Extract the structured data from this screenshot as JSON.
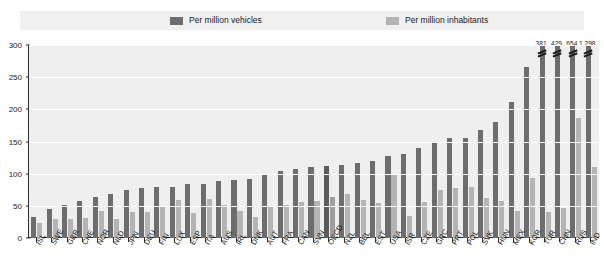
{
  "legend": {
    "items": [
      {
        "label": "Per million vehicles",
        "color": "#6d6d6d",
        "icon": "square-swatch-icon"
      },
      {
        "label": "Per million inhabitants",
        "color": "#b4b4b4",
        "icon": "square-swatch-icon"
      }
    ]
  },
  "chart_data": {
    "type": "bar",
    "title": "",
    "xlabel": "",
    "ylabel": "",
    "ylim": [
      0,
      300
    ],
    "yticks": [
      0,
      50,
      100,
      150,
      200,
      250,
      300
    ],
    "ytick_labels": [
      "0",
      "50",
      "100",
      "150",
      "200",
      "250",
      "300"
    ],
    "grid": true,
    "legend_position": "top",
    "highlight_category": "OECD",
    "axis_break_note": "Values above 300 are clipped; true values shown as labels above the bars.",
    "categories": [
      "ISL",
      "SWE",
      "GBR",
      "CHE",
      "NOR",
      "NLD",
      "JPN",
      "DEU",
      "FIN",
      "LUX",
      "ESP",
      "ITA",
      "AUS",
      "IRL",
      "DNK",
      "AUT",
      "FRA",
      "CAN",
      "SVN",
      "OECD",
      "NZL",
      "BEL",
      "EST",
      "USA",
      "ISR",
      "CZE",
      "GRC",
      "PRT",
      "POL",
      "SVK",
      "HUN",
      "MEX",
      "KOR",
      "TUR",
      "CHN",
      "RUS",
      "IND"
    ],
    "series": [
      {
        "name": "Per million vehicles",
        "color": "#6d6d6d",
        "values": [
          32,
          45,
          52,
          57,
          63,
          68,
          74,
          78,
          79,
          80,
          84,
          84,
          89,
          90,
          92,
          98,
          104,
          107,
          110,
          112,
          113,
          116,
          120,
          127,
          130,
          140,
          148,
          155,
          156,
          168,
          180,
          212,
          266,
          381,
          429,
          654,
          1298
        ],
        "clipped_indices": [
          33,
          34,
          35,
          36
        ],
        "clipped_labels": [
          "381",
          "429",
          "654",
          "1 298"
        ]
      },
      {
        "name": "Per million inhabitants",
        "color": "#b4b4b4",
        "values": [
          24,
          30,
          29,
          31,
          42,
          29,
          40,
          41,
          48,
          59,
          39,
          61,
          52,
          42,
          33,
          49,
          52,
          56,
          58,
          63,
          68,
          59,
          55,
          100,
          34,
          56,
          74,
          78,
          80,
          62,
          58,
          42,
          93,
          40,
          46,
          186,
          110
        ]
      }
    ]
  }
}
